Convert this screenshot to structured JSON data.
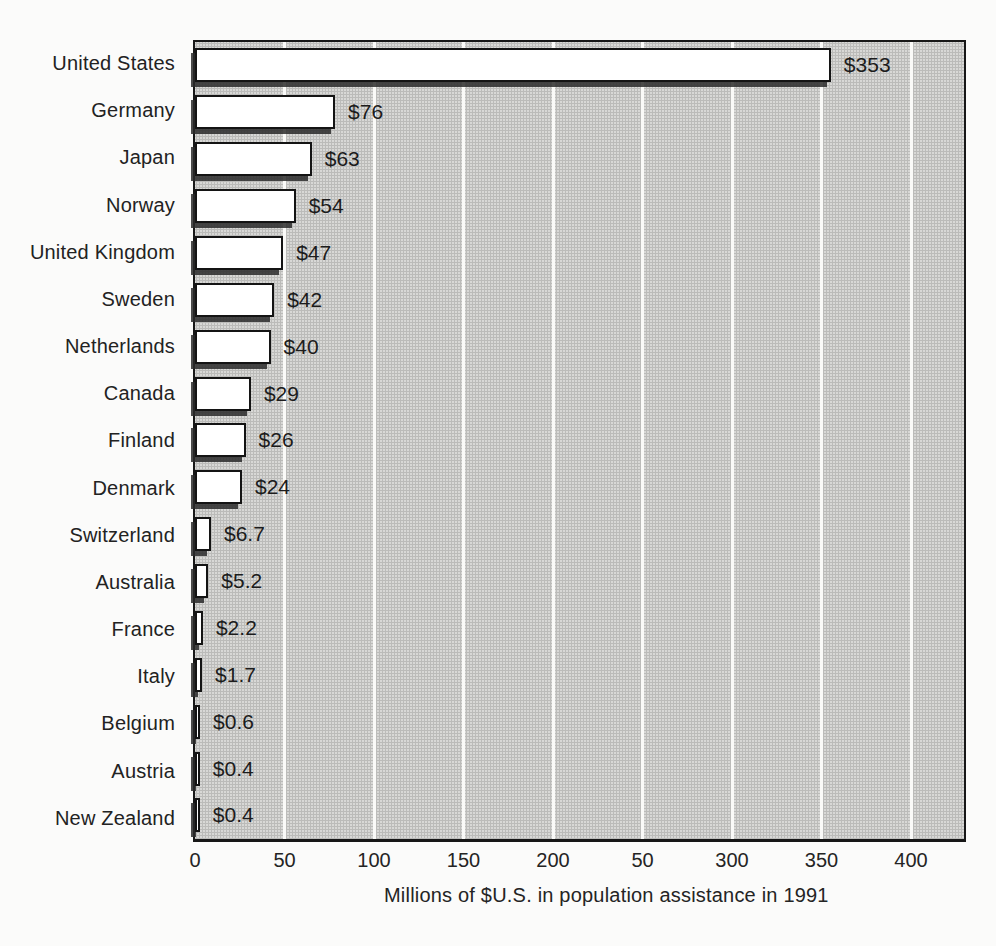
{
  "chart_data": {
    "type": "bar",
    "orientation": "horizontal",
    "title": "",
    "xlabel": "Millions of $U.S. in population assistance in 1991",
    "ylabel": "",
    "xlim": [
      0,
      430
    ],
    "grid": "vertical white gridlines every 50 units",
    "legend": "none",
    "categories": [
      "United States",
      "Germany",
      "Japan",
      "Norway",
      "United Kingdom",
      "Sweden",
      "Netherlands",
      "Canada",
      "Finland",
      "Denmark",
      "Switzerland",
      "Australia",
      "France",
      "Italy",
      "Belgium",
      "Austria",
      "New Zealand"
    ],
    "values": [
      353,
      76,
      63,
      54,
      47,
      42,
      40,
      29,
      26,
      24,
      6.7,
      5.2,
      2.2,
      1.7,
      0.6,
      0.4,
      0.4
    ],
    "value_labels": [
      "$353",
      "$76",
      "$63",
      "$54",
      "$47",
      "$42",
      "$40",
      "$29",
      "$26",
      "$24",
      "$6.7",
      "$5.2",
      "$2.2",
      "$1.7",
      "$0.6",
      "$0.4",
      "$0.4"
    ],
    "xticks": [
      {
        "value": 0,
        "label": "0"
      },
      {
        "value": 50,
        "label": "50"
      },
      {
        "value": 100,
        "label": "100"
      },
      {
        "value": 150,
        "label": "150"
      },
      {
        "value": 200,
        "label": "200"
      },
      {
        "value": 250,
        "label": "50"
      },
      {
        "value": 300,
        "label": "300"
      },
      {
        "value": 350,
        "label": "350"
      },
      {
        "value": 400,
        "label": "400"
      }
    ],
    "colors": {
      "bar_fill": "#ffffff",
      "bar_border": "#141414",
      "bar_shadow": "#2a2a2a",
      "plot_background": "#d8d8d6",
      "gridline": "#fafaf8",
      "page_background": "#fbfbfa",
      "text": "#222222"
    }
  }
}
